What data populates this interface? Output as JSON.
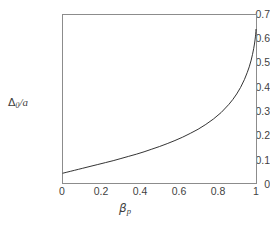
{
  "chart_data": {
    "type": "line",
    "title": "",
    "xlabel": "β_p",
    "ylabel": "Δ_0/a",
    "xlim": [
      0,
      1
    ],
    "ylim": [
      0,
      0.7
    ],
    "grid": false,
    "legend": null,
    "x_ticks": [
      0,
      0.2,
      0.4,
      0.6,
      0.8,
      1
    ],
    "x_tick_labels": [
      "0",
      "0.2",
      "0.4",
      "0.6",
      "0.8",
      "1"
    ],
    "y_ticks": [
      0,
      0.1,
      0.2,
      0.3,
      0.4,
      0.5,
      0.6,
      0.7
    ],
    "y_tick_labels": [
      "0",
      "0.1",
      "0.2",
      "0.3",
      "0.4",
      "0.5",
      "0.6",
      "0.7"
    ],
    "series": [
      {
        "name": "Delta0/a vs beta_p",
        "color": "#1a1a1a",
        "line_width": 0.9,
        "x": [
          0.0,
          0.02,
          0.04,
          0.06,
          0.08,
          0.1,
          0.14,
          0.18,
          0.22,
          0.26,
          0.3,
          0.34,
          0.38,
          0.42,
          0.46,
          0.5,
          0.54,
          0.58,
          0.62,
          0.66,
          0.7,
          0.74,
          0.78,
          0.82,
          0.86,
          0.88,
          0.9,
          0.92,
          0.94,
          0.955,
          0.965,
          0.975,
          0.982,
          0.988,
          0.992,
          0.995,
          0.997,
          0.9985,
          0.9995,
          1.0
        ],
        "y": [
          0.041,
          0.045,
          0.049,
          0.053,
          0.057,
          0.061,
          0.069,
          0.077,
          0.085,
          0.093,
          0.102,
          0.111,
          0.12,
          0.13,
          0.141,
          0.152,
          0.164,
          0.177,
          0.191,
          0.207,
          0.224,
          0.244,
          0.267,
          0.294,
          0.328,
          0.348,
          0.371,
          0.398,
          0.431,
          0.461,
          0.484,
          0.512,
          0.536,
          0.56,
          0.579,
          0.596,
          0.609,
          0.62,
          0.632,
          0.64
        ]
      }
    ]
  },
  "axes": {
    "y_label_parts": {
      "delta": "Δ",
      "zero": "0",
      "slash": "/",
      "a": "a"
    },
    "x_label_parts": {
      "beta": "β",
      "p": "p"
    }
  }
}
